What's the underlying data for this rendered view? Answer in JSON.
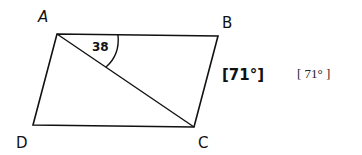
{
  "figure": {
    "type": "parallelogram with diagonal",
    "vertices": {
      "A": {
        "label": "A"
      },
      "B": {
        "label": "B"
      },
      "C": {
        "label": "C"
      },
      "D": {
        "label": "D"
      }
    },
    "diagonal": "AC",
    "angle_label": "38",
    "angle_at": "A (between AB and AC)",
    "handwritten_answer": "[71°]",
    "typed_answer": "[ 71° ]"
  }
}
